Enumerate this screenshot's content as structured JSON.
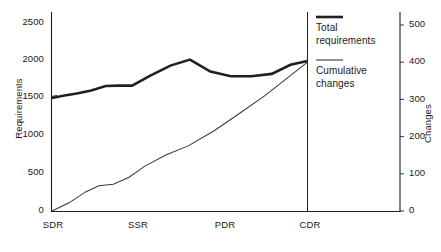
{
  "chart_data": {
    "type": "line",
    "title": "",
    "xlabel": "",
    "ylabel": "Requirements",
    "y2label": "Changes",
    "grid": false,
    "legend_position": "right",
    "x_categories": [
      "SDR",
      "SSR",
      "PDR",
      "CDR"
    ],
    "x_tick_values": [
      0,
      1,
      2,
      3
    ],
    "xlim": [
      0,
      3
    ],
    "ylim": [
      0,
      2500
    ],
    "y_ticks": [
      0,
      500,
      1000,
      1500,
      2000,
      2500
    ],
    "y2lim": [
      0,
      500
    ],
    "y2_ticks": [
      0,
      100,
      200,
      300,
      400,
      500
    ],
    "series": [
      {
        "name": "Total requirements",
        "axis": "left",
        "style": "thick",
        "x": [
          0.0,
          0.13,
          0.29,
          0.46,
          0.63,
          0.78,
          0.94,
          1.16,
          1.39,
          1.62,
          1.86,
          2.1,
          2.34,
          2.58,
          2.8,
          3.0
        ],
        "values": [
          1500,
          1530,
          1560,
          1600,
          1660,
          1665,
          1665,
          1800,
          1930,
          2010,
          1850,
          1790,
          1790,
          1820,
          1940,
          1990
        ]
      },
      {
        "name": "Cumulative changes",
        "axis": "right",
        "style": "thin",
        "x": [
          0.0,
          0.2,
          0.4,
          0.55,
          0.72,
          0.9,
          1.1,
          1.35,
          1.6,
          1.9,
          2.2,
          2.5,
          2.75,
          3.0
        ],
        "values": [
          0,
          22,
          52,
          68,
          72,
          90,
          122,
          152,
          175,
          215,
          262,
          310,
          355,
          400
        ]
      }
    ],
    "legend": [
      {
        "label_line1": "Total",
        "label_line2": "requirements",
        "style": "thick"
      },
      {
        "label_line1": "Cumulative",
        "label_line2": "changes",
        "style": "thin"
      }
    ],
    "colors": {
      "line_thick": "#231f20",
      "line_thin": "#3a3a3a",
      "axis": "#231f20",
      "text": "#1a1a1a"
    }
  },
  "axes": {
    "left": {
      "title": "Requirements",
      "ticks": [
        "2500",
        "2000",
        "1500",
        "1000",
        "500",
        "0"
      ]
    },
    "right": {
      "title": "Changes",
      "ticks": [
        "500",
        "400",
        "300",
        "200",
        "100",
        "0"
      ]
    },
    "bottom": {
      "ticks": [
        "SDR",
        "SSR",
        "PDR",
        "CDR"
      ]
    }
  },
  "legend": {
    "entries": [
      {
        "line1": "Total",
        "line2": "requirements"
      },
      {
        "line1": "Cumulative",
        "line2": "changes"
      }
    ]
  },
  "caption": {
    "text": ""
  }
}
